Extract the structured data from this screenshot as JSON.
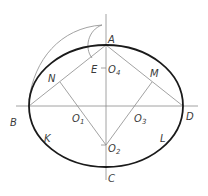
{
  "figure": {
    "type": "four-center approximate ellipse construction",
    "labels": {
      "A": "A",
      "B": "B",
      "C": "C",
      "D": "D",
      "E": "E",
      "M": "M",
      "N": "N",
      "K": "K",
      "L": "L",
      "O1": "O",
      "O1_sub": "1",
      "O2": "O",
      "O2_sub": "2",
      "O3": "O",
      "O3_sub": "3",
      "O4": "O",
      "O4_sub": "4"
    },
    "colors": {
      "outline": "#1a1a1a",
      "construction": "#8a8a8a",
      "text": "#3a3a3a"
    }
  },
  "caption": ""
}
